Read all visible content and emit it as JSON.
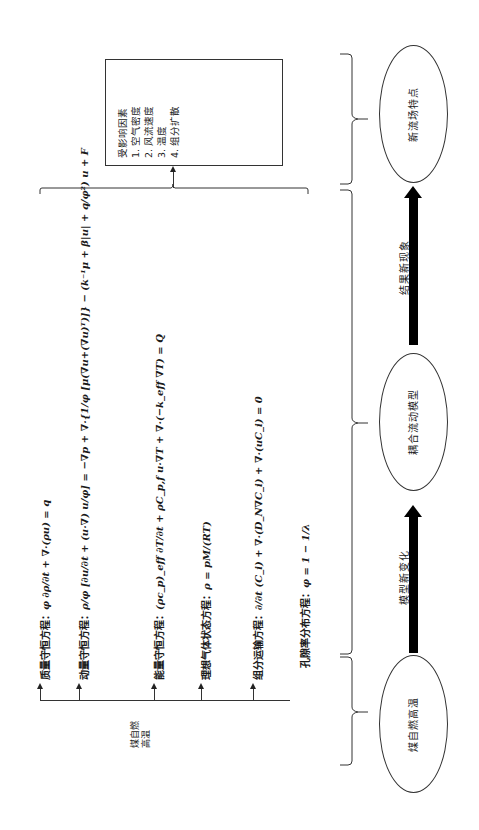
{
  "source_node": {
    "label": "煤自燃\n高温"
  },
  "equations": [
    {
      "label": "质量守恒方程：",
      "formula": "φ ∂ρ/∂t + ∇·(ρu) = q"
    },
    {
      "label": "动量守恒方程：",
      "formula": "ρ/φ [∂u/∂t + (u·∇) u/φ] = −∇p + ∇·{1/φ [μ(∇u+(∇u)ᵀ)]} − (k⁻¹μ + β|u| + q/φ²) u + F"
    },
    {
      "label": "能量守恒方程：",
      "formula": "(ρc_p)_eff ∂T/∂t + ρC_p,f u·∇T + ∇·(−k_eff ∇T) = Q"
    },
    {
      "label": "理想气体状态方程：",
      "formula": "ρ = pM/(RT)"
    },
    {
      "label": "组分运输方程：",
      "formula": "∂/∂t (C_i) + ∇·(D_N∇C_i) + ∇·(uC_i) = 0"
    },
    {
      "label": "孔隙率分布方程：",
      "formula": "φ = 1 − 1/λ"
    }
  ],
  "factors_box": {
    "title": "受影响因素",
    "items": [
      "1. 空气密度",
      "2. 风流速度",
      "3. 温度",
      "4. 组分扩散"
    ]
  },
  "flow": {
    "nodes": [
      {
        "label": "煤自燃高温"
      },
      {
        "label": "耦合流动模型"
      },
      {
        "label": "新流场特点"
      }
    ],
    "transitions": [
      {
        "label": "模型新变化"
      },
      {
        "label": "结果新现象"
      }
    ]
  }
}
